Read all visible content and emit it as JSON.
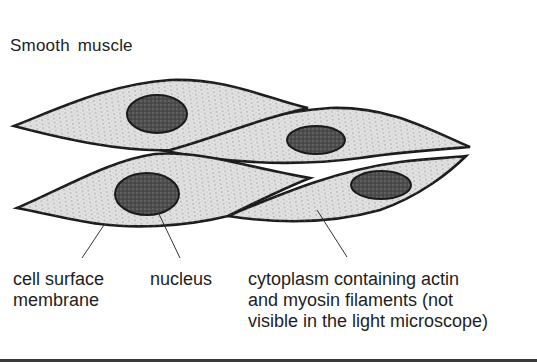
{
  "title": "Smooth  muscle",
  "labels": {
    "cell_surface_membrane": [
      "cell surface",
      "membrane"
    ],
    "nucleus": [
      "nucleus"
    ],
    "cytoplasm": [
      "cytoplasm containing actin",
      "and myosin filaments (not",
      "visible in the light microscope)"
    ]
  },
  "colors": {
    "cytoplasm_fill": "#e2e2e2",
    "outline": "#1a1a1a",
    "nucleus_fill": "#4a4a4a",
    "stipple": "#7a7a7a"
  },
  "cells": [
    {
      "id": "cell-1",
      "nucleus": {
        "cx": 157,
        "cy": 114,
        "rx": 30,
        "ry": 19
      }
    },
    {
      "id": "cell-2",
      "nucleus": {
        "cx": 316,
        "cy": 140,
        "rx": 29,
        "ry": 14
      }
    },
    {
      "id": "cell-3",
      "nucleus": {
        "cx": 147,
        "cy": 194,
        "rx": 32,
        "ry": 21
      }
    },
    {
      "id": "cell-4",
      "nucleus": {
        "cx": 381,
        "cy": 185,
        "rx": 30,
        "ry": 14
      }
    }
  ]
}
